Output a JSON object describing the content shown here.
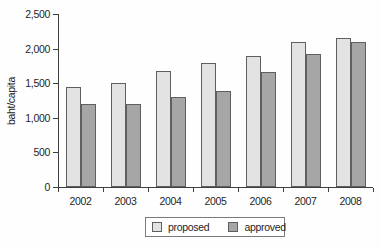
{
  "chart_data": {
    "type": "bar",
    "title": "",
    "ylabel": "baht/capita",
    "xlabel": "",
    "categories": [
      "2002",
      "2003",
      "2004",
      "2005",
      "2006",
      "2007",
      "2008"
    ],
    "series": [
      {
        "name": "proposed",
        "color": "#e3e3e3",
        "values": [
          1450,
          1500,
          1670,
          1790,
          1900,
          2100,
          2150
        ]
      },
      {
        "name": "approved",
        "color": "#a6a6a6",
        "values": [
          1200,
          1200,
          1300,
          1390,
          1660,
          1920,
          2100
        ]
      }
    ],
    "ylim": [
      0,
      2500
    ],
    "ytick_step": 500,
    "ytick_labels": [
      "0",
      "500",
      "1,000",
      "1,500",
      "2,000",
      "2,500"
    ],
    "grid": false,
    "legend_position": "bottom-center"
  },
  "colors": {
    "axis": "#3f3f3f",
    "bar_border": "#5f5f5f",
    "text": "#1f1f1f",
    "legend_border": "#7a7a7a",
    "background": "#fefefe"
  }
}
